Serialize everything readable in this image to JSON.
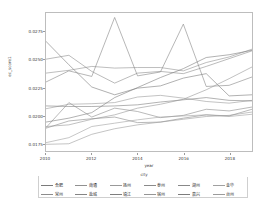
{
  "chart_data": {
    "type": "line",
    "title": "",
    "xlabel": "year",
    "ylabel": "ec_score1",
    "legend_title": "city",
    "legend_position": "bottom",
    "grid": false,
    "x": [
      2010,
      2011,
      2012,
      2013,
      2014,
      2015,
      2016,
      2017,
      2018,
      2019
    ],
    "xlim": [
      2010,
      2019
    ],
    "ylim": [
      0.0168,
      0.0292
    ],
    "xticks": [
      "2010",
      "2012",
      "2014",
      "2016",
      "2018"
    ],
    "xtick_values": [
      2010,
      2012,
      2014,
      2016,
      2018
    ],
    "yticks": [
      "0.0175",
      "0.0200",
      "0.0225",
      "0.0250",
      "0.0275"
    ],
    "ytick_values": [
      0.0175,
      0.02,
      0.0225,
      0.025,
      0.0275
    ],
    "series": [
      {
        "name": "合肥",
        "color": "#7a7a7a",
        "values": [
          0.02665,
          0.02455,
          0.02255,
          0.02185,
          0.02245,
          0.02265,
          0.02335,
          0.02375,
          0.02175,
          0.02185
        ]
      },
      {
        "name": "常州",
        "color": "#8c8c8c",
        "values": [
          0.02505,
          0.0254,
          0.02395,
          0.0229,
          0.0238,
          0.02395,
          0.02375,
          0.0244,
          0.0251,
          0.0258
        ]
      },
      {
        "name": "南通",
        "color": "#909090",
        "values": [
          0.0238,
          0.02405,
          0.0244,
          0.02425,
          0.0243,
          0.0243,
          0.024,
          0.02475,
          0.02525,
          0.02595
        ]
      },
      {
        "name": "盐城",
        "color": "#848484",
        "values": [
          0.023,
          0.024,
          0.0235,
          0.0288,
          0.02355,
          0.0239,
          0.0282,
          0.0226,
          0.0227,
          0.02345
        ]
      },
      {
        "name": "扬州",
        "color": "#999999",
        "values": [
          0.0206,
          0.021,
          0.02105,
          0.02115,
          0.02165,
          0.0218,
          0.02155,
          0.02125,
          0.0211,
          0.02135
        ]
      },
      {
        "name": "镇江",
        "color": "#7e7e7e",
        "values": [
          0.02085,
          0.0208,
          0.0208,
          0.02085,
          0.02095,
          0.0212,
          0.0214,
          0.0216,
          0.02135,
          0.0213
        ]
      },
      {
        "name": "泰州",
        "color": "#8a8a8a",
        "values": [
          0.0189,
          0.02115,
          0.01985,
          0.02065,
          0.02035,
          0.0198,
          0.02,
          0.02055,
          0.0204,
          0.02075
        ]
      },
      {
        "name": "宿州",
        "color": "#959595",
        "values": [
          0.019,
          0.01915,
          0.01965,
          0.02005,
          0.02065,
          0.021,
          0.02145,
          0.0223,
          0.0233,
          0.02435
        ]
      },
      {
        "name": "湖州",
        "color": "#888888",
        "values": [
          0.01885,
          0.0195,
          0.0197,
          0.01985,
          0.01935,
          0.0194,
          0.01975,
          0.02005,
          0.01995,
          0.02055
        ]
      },
      {
        "name": "嘉兴",
        "color": "#7c7c7c",
        "values": [
          0.0194,
          0.01975,
          0.02025,
          0.0216,
          0.0225,
          0.0234,
          0.0242,
          0.0252,
          0.02545,
          0.02585
        ]
      },
      {
        "name": "金华",
        "color": "#a0a0a0",
        "values": [
          0.01755,
          0.018,
          0.019,
          0.0193,
          0.0196,
          0.01985,
          0.01995,
          0.02005,
          0.0199,
          0.0201
        ]
      },
      {
        "name": "台州",
        "color": "#9b9b9b",
        "values": [
          0.0174,
          0.01745,
          0.0183,
          0.0188,
          0.01915,
          0.0194,
          0.01965,
          0.0199,
          0.02,
          0.0203
        ]
      }
    ]
  }
}
